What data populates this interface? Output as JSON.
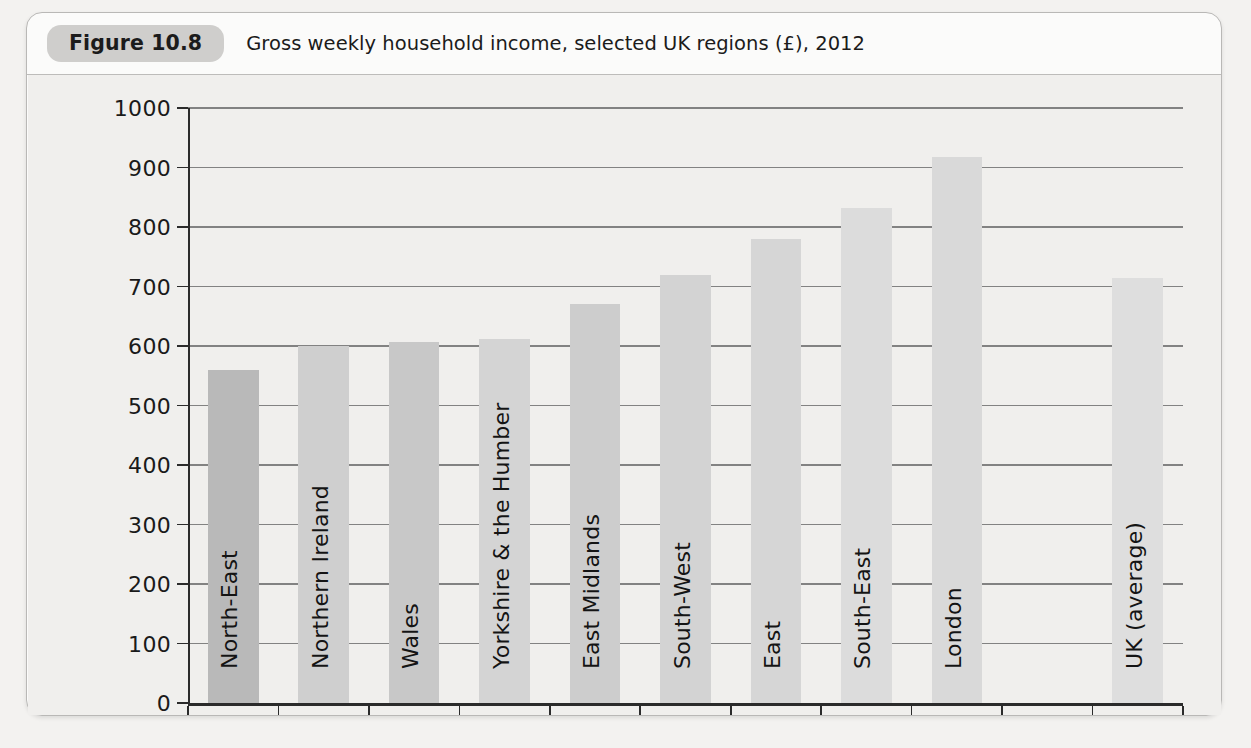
{
  "figure": {
    "number": "Figure 10.8",
    "caption": "Gross weekly household income, selected UK regions (£), 2012"
  },
  "chart_data": {
    "type": "bar",
    "title": "Gross weekly household income, selected UK regions (£), 2012",
    "xlabel": "",
    "ylabel": "",
    "ylim": [
      0,
      1000
    ],
    "ytick_step": 100,
    "yticks": [
      "0",
      "100",
      "200",
      "300",
      "400",
      "500",
      "600",
      "700",
      "800",
      "900",
      "1000"
    ],
    "grid": true,
    "legend": "none",
    "categories": [
      "North-East",
      "Northern Ireland",
      "Wales",
      "Yorkshire & the Humber",
      "East Midlands",
      "South-West",
      "East",
      "South-East",
      "London",
      "UK (average)"
    ],
    "values": [
      560,
      600,
      607,
      612,
      670,
      720,
      780,
      832,
      918,
      715
    ],
    "bar_colors": [
      "#b9b9b9",
      "#cfcfcf",
      "#c8c8c8",
      "#d4d4d4",
      "#cdcdcd",
      "#d3d3d3",
      "#d6d6d6",
      "#dcdcdc",
      "#d9d9d9",
      "#dedede"
    ],
    "gap_after_index": 8
  },
  "colors": {
    "plot_background": "#f0efed",
    "frame_background": "#fbfbfa",
    "page_background": "#f3f2f0",
    "axis": "#2b2b2b",
    "gridline": "#6e6e6e",
    "pill": "#cfcecc",
    "text": "#1b1b1b"
  }
}
